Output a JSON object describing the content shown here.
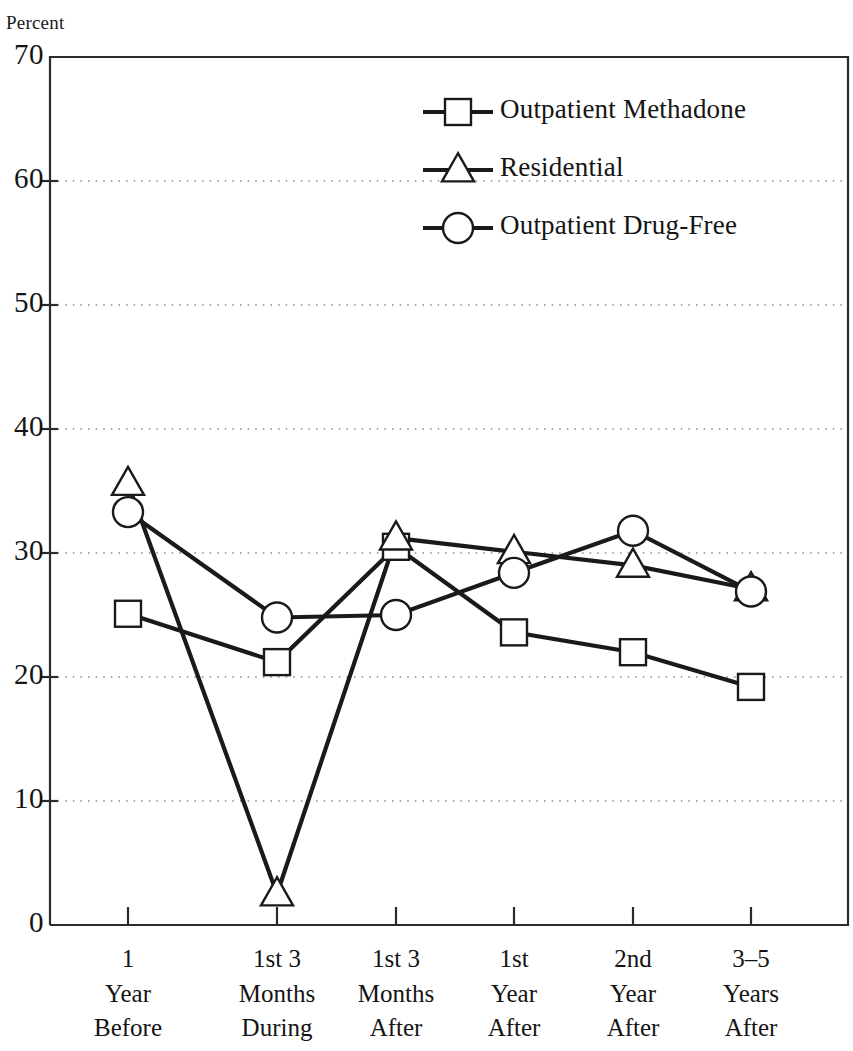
{
  "chart_data": {
    "type": "line",
    "title": "",
    "xlabel": "",
    "ylabel": "Percent",
    "ylim": [
      0,
      70
    ],
    "ytick_values": [
      0,
      10,
      20,
      30,
      40,
      50,
      60,
      70
    ],
    "ytick_labels": [
      "0",
      "10",
      "20",
      "30",
      "40",
      "50",
      "60",
      "70"
    ],
    "grid": "horizontal-dotted",
    "legend_position": "upper-center",
    "categories": [
      "1 Year Before",
      "1st 3 Months During",
      "1st 3 Months After",
      "1st Year After",
      "2nd Year After",
      "3-5 Years After"
    ],
    "category_lines": [
      [
        "1",
        "Year",
        "Before"
      ],
      [
        "1st 3",
        "Months",
        "During"
      ],
      [
        "1st 3",
        "Months",
        "After"
      ],
      [
        "1st",
        "Year",
        "After"
      ],
      [
        "2nd",
        "Year",
        "After"
      ],
      [
        "3–5",
        "Years",
        "After"
      ]
    ],
    "series": [
      {
        "name": "Outpatient Methadone",
        "marker": "square",
        "values": [
          25.1,
          21.2,
          30.5,
          23.6,
          22.0,
          19.2
        ]
      },
      {
        "name": "Residential",
        "marker": "triangle",
        "values": [
          35.6,
          2.5,
          31.2,
          30.1,
          29.0,
          27.1
        ]
      },
      {
        "name": "Outpatient Drug-Free",
        "marker": "circle",
        "values": [
          33.3,
          24.8,
          25.0,
          28.4,
          31.8,
          26.9
        ]
      }
    ]
  },
  "legend": {
    "entries": [
      {
        "label": "Outpatient Methadone",
        "marker": "square"
      },
      {
        "label": "Residential",
        "marker": "triangle"
      },
      {
        "label": "Outpatient Drug-Free",
        "marker": "circle"
      }
    ]
  },
  "colors": {
    "line": "#1a1a1a",
    "marker_fill": "#ffffff",
    "frame": "#2b2b2b",
    "grid": "#8d8d8d",
    "text": "#141414"
  },
  "plot_geometry": {
    "left": 50,
    "right": 848,
    "top": 57,
    "bottom": 925,
    "x_tick_positions": [
      128,
      277,
      396,
      514,
      633,
      751
    ]
  }
}
